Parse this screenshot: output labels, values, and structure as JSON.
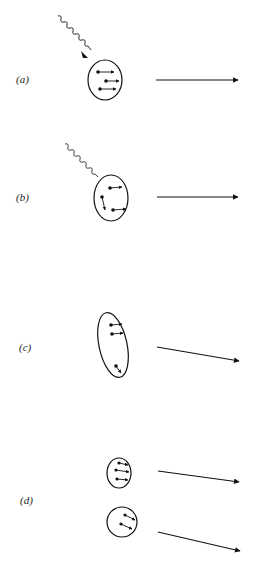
{
  "figure": {
    "panels": [
      {
        "id": "a",
        "label": "(a)",
        "photon": "incoming wavy photon line with arrowhead pointing at cluster",
        "cluster": {
          "shape": "ellipse",
          "particles": 3,
          "particle_motion": "all arrows point right (parallel)"
        },
        "outgoing_arrow": "horizontal, to the right"
      },
      {
        "id": "b",
        "label": "(b)",
        "photon": "wavy line ending at cluster boundary (absorbed)",
        "cluster": {
          "shape": "ellipse",
          "particles": 3,
          "particle_motion": "one particle kicked downward, two moving right"
        },
        "outgoing_arrow": "horizontal, to the right"
      },
      {
        "id": "c",
        "label": "(c)",
        "photon": null,
        "cluster": {
          "shape": "elongated tilted ellipse",
          "particles": 3,
          "particle_motion": "two at top moving right, one at bottom moving down-right"
        },
        "outgoing_arrow": "slightly downward to the right"
      },
      {
        "id": "d",
        "label": "(d)",
        "photon": null,
        "fragments": [
          {
            "shape": "small ellipse",
            "particles": 3,
            "particle_motion": "arrows right, slightly downward"
          },
          {
            "shape": "circle",
            "particles": 2,
            "particle_motion": "arrows down-right"
          }
        ],
        "outgoing_arrows": [
          "slightly downward to the right",
          "more steeply downward to the right"
        ]
      }
    ]
  },
  "labels": {
    "a": "(a)",
    "b": "(b)",
    "c": "(c)",
    "d": "(d)"
  }
}
